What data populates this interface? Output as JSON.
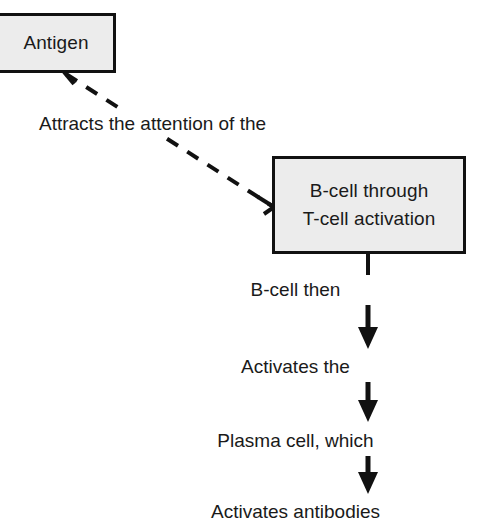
{
  "diagram": {
    "background_color": "#ffffff",
    "box_fill_color": "#ececec",
    "box_border_color": "#111111",
    "text_color": "#1a1a1a"
  },
  "nodes": {
    "antigen": {
      "label": "Antigen"
    },
    "bcell": {
      "line1": "B-cell through",
      "line2": "T-cell activation"
    }
  },
  "connectors": {
    "dashed_label": "Attracts the attention of the"
  },
  "chain": [
    {
      "label": "B-cell then"
    },
    {
      "label": "Activates the"
    },
    {
      "label": "Plasma cell, which"
    },
    {
      "label": "Activates antibodies"
    }
  ]
}
